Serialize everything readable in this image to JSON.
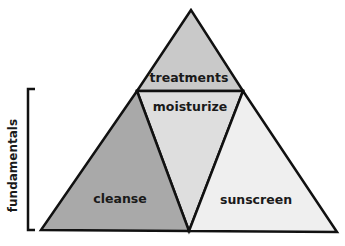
{
  "diagram": {
    "type": "pyramid",
    "segments": [
      {
        "id": "treatments",
        "label": "treatments",
        "fill": "#c9c9c9",
        "points": "191,10 137,91 243,91",
        "label_pos": [
          189,
          82
        ]
      },
      {
        "id": "moisturize",
        "label": "moisturize",
        "fill": "#dedede",
        "points": "137,91 243,91 189,231",
        "label_pos": [
          190,
          111
        ]
      },
      {
        "id": "cleanse",
        "label": "cleanse",
        "fill": "#a9a9a9",
        "points": "137,91 41,230 189,231",
        "label_pos": [
          120,
          203
        ]
      },
      {
        "id": "sunscreen",
        "label": "sunscreen",
        "fill": "#efefef",
        "points": "243,91 189,231 337,232",
        "label_pos": [
          256,
          204
        ]
      }
    ],
    "bracket": {
      "label": "fundamentals",
      "top_y": 89,
      "bottom_y": 230,
      "x": 28
    },
    "stroke_color": "#111111"
  }
}
